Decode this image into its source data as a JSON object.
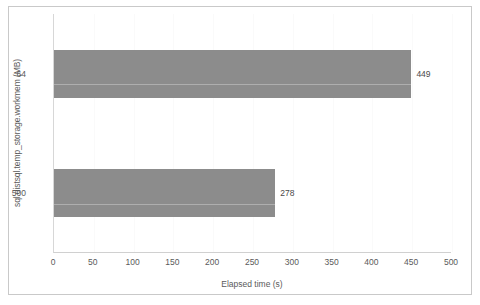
{
  "chart_data": {
    "type": "bar",
    "orientation": "horizontal",
    "title": "",
    "xlabel": "Elapsed time (s)",
    "ylabel": "sql.distsql.temp_storage.workmem (MB)",
    "categories": [
      "64",
      "500"
    ],
    "values": [
      449,
      278
    ],
    "data_labels": [
      "449",
      "278"
    ],
    "xlim": [
      0,
      500
    ],
    "xticks": [
      0,
      50,
      100,
      150,
      200,
      250,
      300,
      350,
      400,
      450,
      500
    ],
    "xtick_labels": [
      "0",
      "50",
      "100",
      "150",
      "200",
      "250",
      "300",
      "350",
      "400",
      "450",
      "500"
    ],
    "grid": "vertical-light",
    "legend": "none",
    "bar_color": "#8c8c8c",
    "frame_color": "#c9c9c9",
    "text_color": "#5a5a5a",
    "background": "#ffffff"
  }
}
